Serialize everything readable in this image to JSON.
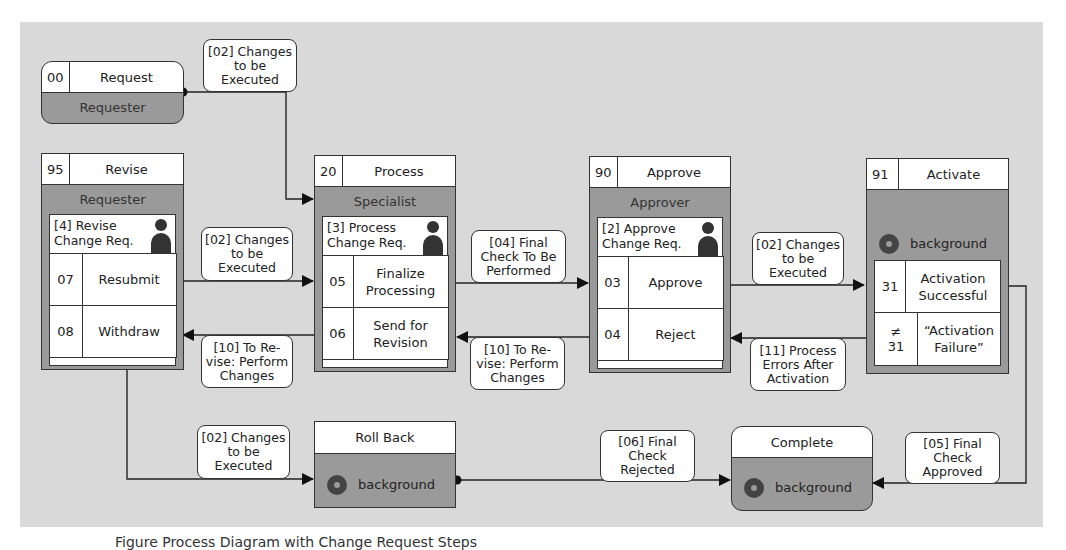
{
  "diagram": {
    "type": "process-flow",
    "colors": {
      "canvas": "#d9d9d9",
      "node_fill": "#9a9a9a",
      "header_fill": "#ffffff",
      "stroke": "#333333"
    },
    "start_node": {
      "num": "00",
      "title": "Request",
      "role": "Requester"
    },
    "nodes": [
      {
        "id": "revise",
        "num": "95",
        "title": "Revise",
        "role": "Requester",
        "task": "[4] Revise\nChange Req.",
        "options": [
          {
            "code": "07",
            "label": "Resubmit"
          },
          {
            "code": "08",
            "label": "Withdraw"
          }
        ]
      },
      {
        "id": "process",
        "num": "20",
        "title": "Process",
        "role": "Specialist",
        "task": "[3] Process\nChange Req.",
        "options": [
          {
            "code": "05",
            "label": "Finalize Processing"
          },
          {
            "code": "06",
            "label": "Send for Revision"
          }
        ]
      },
      {
        "id": "approve",
        "num": "90",
        "title": "Approve",
        "role": "Approver",
        "task": "[2] Approve\nChange Req.",
        "options": [
          {
            "code": "03",
            "label": "Approve"
          },
          {
            "code": "04",
            "label": "Reject"
          }
        ]
      },
      {
        "id": "activate",
        "num": "91",
        "title": "Activate",
        "role": "background",
        "options": [
          {
            "code": "31",
            "label": "Activation Successful"
          },
          {
            "code": "≠ 31",
            "label": "“Activation Failure”"
          }
        ]
      }
    ],
    "end_nodes": [
      {
        "id": "rollback",
        "title": "Roll Back",
        "role": "background"
      },
      {
        "id": "complete",
        "title": "Complete",
        "role": "background"
      }
    ],
    "edge_labels": {
      "request_to_process": "[02] Changes to be Executed",
      "resubmit_to_process": "[02] Changes to be Executed",
      "finalize_to_approve": "[04] Final Check To Be Performed",
      "approve_to_activate": "[02] Changes to be Executed",
      "revision_to_revise": "[10] To Re-vise: Perform Changes",
      "reject_to_process": "[10] To Re-vise: Perform Changes",
      "failure_to_approve": "[11] Process Errors After Activation",
      "withdraw_to_rollback": "[02] Changes to be Executed",
      "rollback_to_complete": "[06] Final Check Rejected",
      "success_to_complete": "[05] Final Check Approved"
    },
    "caption": "Figure  Process Diagram with Change Request Steps"
  }
}
